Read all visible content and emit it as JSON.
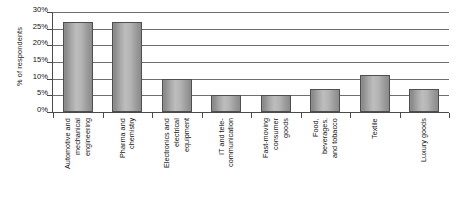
{
  "chart_data": {
    "type": "bar",
    "title": "",
    "xlabel": "",
    "ylabel": "% of respondents",
    "ylim": [
      0,
      30
    ],
    "ytick_labels": [
      "30%",
      "25%",
      "20%",
      "15%",
      "10%",
      "5%",
      "0%"
    ],
    "ytick_values": [
      30,
      25,
      20,
      15,
      10,
      5,
      0
    ],
    "grid": true,
    "legend": false,
    "categories": [
      "Automotive and mechanical engineering",
      "Pharma and chemistry",
      "Electronics and electrical equipment",
      "IT and tele-communication",
      "Fast-moving consumer goods",
      "Food, beverages, and tobacco",
      "Textile",
      "Luxury goods"
    ],
    "category_lines": [
      [
        "Automotive and",
        "mechanical",
        "engineering"
      ],
      [
        "Pharma and",
        "chemistry"
      ],
      [
        "Electronics and",
        "electrical",
        "equipment"
      ],
      [
        "IT and tele-",
        "communication"
      ],
      [
        "Fast-moving",
        "consumer",
        "goods"
      ],
      [
        "Food,",
        "beverages,",
        "and tobacco"
      ],
      [
        "Textile"
      ],
      [
        "Luxury goods"
      ]
    ],
    "values": [
      27,
      27,
      10,
      5,
      5,
      7,
      11,
      7
    ],
    "bar_color": "#a9a9a9",
    "bar_border_color": "#4f4f4f",
    "gridline_color": "#6e6e6e",
    "axis_color": "#4a4a4a",
    "background_color": "#ffffff"
  }
}
